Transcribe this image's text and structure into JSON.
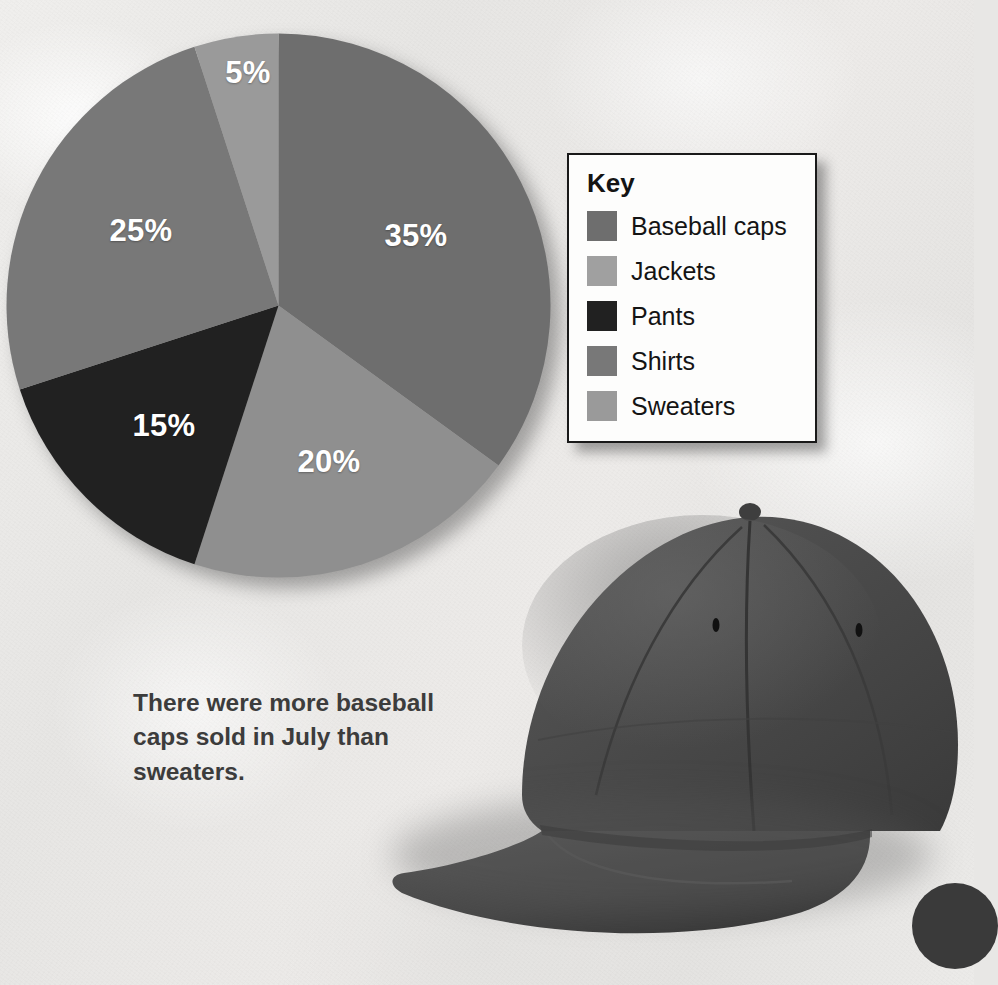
{
  "page": {
    "background_color": "#e8e7e5",
    "caption": "There were more baseball caps sold in July than sweaters."
  },
  "key": {
    "title": "Key",
    "items": [
      {
        "label": "Baseball caps",
        "color": "#6e6e6e"
      },
      {
        "label": "Jackets",
        "color": "#a0a0a0"
      },
      {
        "label": "Pants",
        "color": "#212121"
      },
      {
        "label": "Shirts",
        "color": "#787878"
      },
      {
        "label": "Sweaters",
        "color": "#9a9a9a"
      }
    ]
  },
  "chart_data": {
    "type": "pie",
    "title": "",
    "categories": [
      "Baseball caps",
      "Jackets",
      "Pants",
      "Shirts",
      "Sweaters"
    ],
    "values": [
      35,
      20,
      15,
      25,
      5
    ],
    "labels": [
      "35%",
      "20%",
      "15%",
      "25%",
      "5%"
    ],
    "colors": [
      "#6e6e6e",
      "#8f8f8f",
      "#212121",
      "#787878",
      "#9a9a9a"
    ],
    "units": "percent",
    "total": 100,
    "start_angle_deg": 0,
    "direction": "clockwise",
    "legend_position": "right",
    "grid": false,
    "label_color": "#ffffff",
    "label_positions": [
      {
        "text": "35%",
        "x": 416,
        "y": 236
      },
      {
        "text": "20%",
        "x": 329,
        "y": 462
      },
      {
        "text": "15%",
        "x": 164,
        "y": 426
      },
      {
        "text": "25%",
        "x": 141,
        "y": 231
      },
      {
        "text": "5%",
        "x": 248,
        "y": 73
      }
    ],
    "geometry": {
      "cx": 278,
      "cy": 305,
      "r": 272
    }
  },
  "photo": {
    "subject": "baseball-cap",
    "color": "#4a4a4a"
  }
}
